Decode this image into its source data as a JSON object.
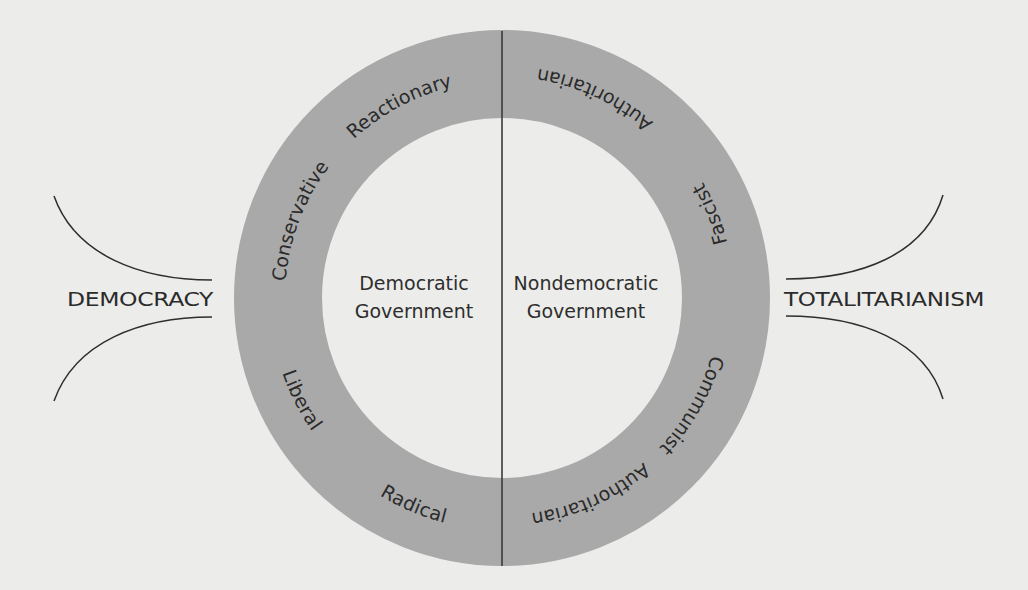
{
  "diagram": {
    "type": "political-spectrum-ring",
    "colors": {
      "background": "#ececea",
      "ring": "#a9a9a9",
      "ink": "#2a2a2a"
    },
    "side_labels": {
      "left": "DEMOCRACY",
      "right": "TOTALITARIANISM"
    },
    "center_labels": {
      "left_line1": "Democratic",
      "left_line2": "Government",
      "right_line1": "Nondemocratic",
      "right_line2": "Government"
    },
    "ring_labels": {
      "reactionary": "Reactionary",
      "conservative": "Conservative",
      "liberal": "Liberal",
      "radical": "Radical",
      "authoritarian_top": "Authoritarian",
      "fascist": "Fascist",
      "communist": "Communist",
      "authoritarian_bottom": "Authoritarian"
    }
  }
}
